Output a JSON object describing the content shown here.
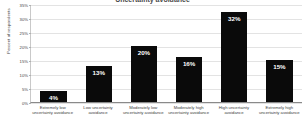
{
  "chart_data": {
    "type": "bar",
    "title": "Uncertainty avoidance",
    "xlabel": "",
    "ylabel": "Percent of respondents",
    "categories": [
      "Extremely low uncertainty avoidance",
      "Low uncertainty avoidance",
      "Moderately low uncertainty avoidance",
      "Moderately high uncertainty avoidance",
      "High uncertainty avoidance",
      "Extremely high uncertainty avoidance"
    ],
    "values": [
      4,
      13,
      20,
      16,
      32,
      15
    ],
    "value_labels": [
      "4%",
      "13%",
      "20%",
      "16%",
      "32%",
      "15%"
    ],
    "ylim": [
      0,
      35
    ],
    "ytick_values": [
      0,
      5,
      10,
      15,
      20,
      25,
      30,
      35
    ],
    "ytick_labels": [
      "0%",
      "5%",
      "10%",
      "15%",
      "20%",
      "25%",
      "30%",
      "35%"
    ],
    "grid": true,
    "legend": false,
    "bar_color": "#0a0a0a",
    "value_label_color": "#ffffff",
    "gridline_color": "#e3e3e3",
    "axis_color": "#8a8a8a",
    "background_color": "#ffffff"
  }
}
